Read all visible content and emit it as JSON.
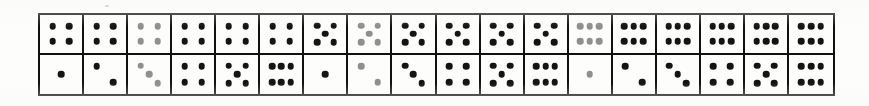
{
  "figure": {
    "type": "dice-face-grid",
    "rows": 2,
    "columns": 18,
    "pip_color": "#141414",
    "faded_pip_color": "#8f8f8f",
    "border_color": "#111111",
    "background_color": "#ffffff"
  },
  "chart_data": {
    "type": "table",
    "title": "",
    "xlabel": "",
    "ylabel": "",
    "categories": [
      "1",
      "2",
      "3",
      "4",
      "5",
      "6",
      "7",
      "8",
      "9",
      "10",
      "11",
      "12",
      "13",
      "14",
      "15",
      "16",
      "17",
      "18"
    ],
    "series": [
      {
        "name": "top-row",
        "values": [
          4,
          4,
          4,
          4,
          4,
          4,
          5,
          5,
          5,
          5,
          5,
          5,
          6,
          6,
          6,
          6,
          6,
          6
        ]
      },
      {
        "name": "bottom-row",
        "values": [
          1,
          2,
          3,
          4,
          5,
          6,
          1,
          2,
          3,
          4,
          5,
          6,
          1,
          2,
          3,
          4,
          5,
          6
        ]
      }
    ]
  },
  "cells": [
    {
      "index": 0,
      "row": 0,
      "col": 0,
      "value": 4,
      "faded": false
    },
    {
      "index": 1,
      "row": 0,
      "col": 1,
      "value": 4,
      "faded": false
    },
    {
      "index": 2,
      "row": 0,
      "col": 2,
      "value": 4,
      "faded": true
    },
    {
      "index": 3,
      "row": 0,
      "col": 3,
      "value": 4,
      "faded": false
    },
    {
      "index": 4,
      "row": 0,
      "col": 4,
      "value": 4,
      "faded": false
    },
    {
      "index": 5,
      "row": 0,
      "col": 5,
      "value": 4,
      "faded": false
    },
    {
      "index": 6,
      "row": 0,
      "col": 6,
      "value": 5,
      "faded": false
    },
    {
      "index": 7,
      "row": 0,
      "col": 7,
      "value": 5,
      "faded": true
    },
    {
      "index": 8,
      "row": 0,
      "col": 8,
      "value": 5,
      "faded": false
    },
    {
      "index": 9,
      "row": 0,
      "col": 9,
      "value": 5,
      "faded": false
    },
    {
      "index": 10,
      "row": 0,
      "col": 10,
      "value": 5,
      "faded": false
    },
    {
      "index": 11,
      "row": 0,
      "col": 11,
      "value": 5,
      "faded": false
    },
    {
      "index": 12,
      "row": 0,
      "col": 12,
      "value": 6,
      "faded": true
    },
    {
      "index": 13,
      "row": 0,
      "col": 13,
      "value": 6,
      "faded": false
    },
    {
      "index": 14,
      "row": 0,
      "col": 14,
      "value": 6,
      "faded": false
    },
    {
      "index": 15,
      "row": 0,
      "col": 15,
      "value": 6,
      "faded": false
    },
    {
      "index": 16,
      "row": 0,
      "col": 16,
      "value": 6,
      "faded": false
    },
    {
      "index": 17,
      "row": 0,
      "col": 17,
      "value": 6,
      "faded": false
    },
    {
      "index": 18,
      "row": 1,
      "col": 0,
      "value": 1,
      "faded": false
    },
    {
      "index": 19,
      "row": 1,
      "col": 1,
      "value": 2,
      "faded": false
    },
    {
      "index": 20,
      "row": 1,
      "col": 2,
      "value": 3,
      "faded": true
    },
    {
      "index": 21,
      "row": 1,
      "col": 3,
      "value": 4,
      "faded": false
    },
    {
      "index": 22,
      "row": 1,
      "col": 4,
      "value": 5,
      "faded": false
    },
    {
      "index": 23,
      "row": 1,
      "col": 5,
      "value": 6,
      "faded": false
    },
    {
      "index": 24,
      "row": 1,
      "col": 6,
      "value": 1,
      "faded": false
    },
    {
      "index": 25,
      "row": 1,
      "col": 7,
      "value": 2,
      "faded": true
    },
    {
      "index": 26,
      "row": 1,
      "col": 8,
      "value": 3,
      "faded": false
    },
    {
      "index": 27,
      "row": 1,
      "col": 9,
      "value": 4,
      "faded": false
    },
    {
      "index": 28,
      "row": 1,
      "col": 10,
      "value": 5,
      "faded": false
    },
    {
      "index": 29,
      "row": 1,
      "col": 11,
      "value": 6,
      "faded": false
    },
    {
      "index": 30,
      "row": 1,
      "col": 12,
      "value": 1,
      "faded": true
    },
    {
      "index": 31,
      "row": 1,
      "col": 13,
      "value": 2,
      "faded": false
    },
    {
      "index": 32,
      "row": 1,
      "col": 14,
      "value": 3,
      "faded": false
    },
    {
      "index": 33,
      "row": 1,
      "col": 15,
      "value": 4,
      "faded": false
    },
    {
      "index": 34,
      "row": 1,
      "col": 16,
      "value": 5,
      "faded": false
    },
    {
      "index": 35,
      "row": 1,
      "col": 17,
      "value": 6,
      "faded": false
    }
  ],
  "pip_layouts": {
    "1": [
      [
        50,
        50
      ]
    ],
    "2": [
      [
        30,
        30
      ],
      [
        70,
        70
      ]
    ],
    "3": [
      [
        30,
        28
      ],
      [
        50,
        50
      ],
      [
        70,
        72
      ]
    ],
    "4": [
      [
        30,
        30
      ],
      [
        70,
        30
      ],
      [
        30,
        70
      ],
      [
        70,
        70
      ]
    ],
    "5": [
      [
        30,
        28
      ],
      [
        70,
        28
      ],
      [
        50,
        50
      ],
      [
        30,
        72
      ],
      [
        70,
        72
      ]
    ],
    "6": [
      [
        28,
        30
      ],
      [
        50,
        30
      ],
      [
        72,
        30
      ],
      [
        28,
        70
      ],
      [
        50,
        70
      ],
      [
        72,
        70
      ]
    ]
  }
}
